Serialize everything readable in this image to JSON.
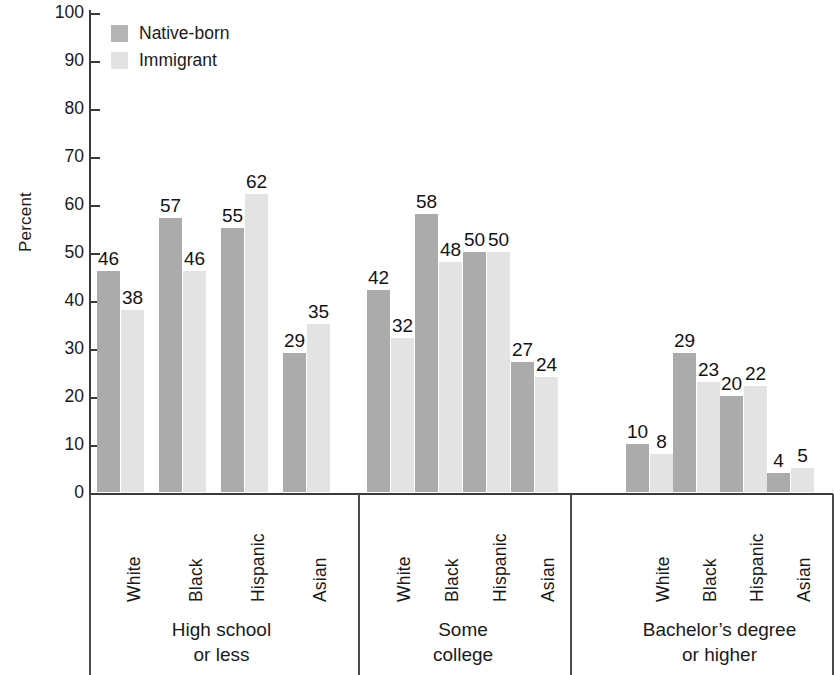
{
  "chart_data": {
    "type": "bar",
    "title": "",
    "xlabel": "",
    "ylabel": "Percent",
    "ylim": [
      0,
      100
    ],
    "ytick_step": 10,
    "yticks": [
      100,
      90,
      80,
      70,
      60,
      50,
      40,
      30,
      20,
      10,
      0
    ],
    "grid": false,
    "legend_position": "top-left",
    "orientation": "vertical",
    "groups": [
      {
        "title_line1": "High school",
        "title_line2": "or less",
        "categories": [
          "White",
          "Black",
          "Hispanic",
          "Asian"
        ],
        "series": [
          {
            "name": "Native-born",
            "values": [
              46,
              57,
              55,
              29
            ]
          },
          {
            "name": "Immigrant",
            "values": [
              38,
              46,
              62,
              35
            ]
          }
        ]
      },
      {
        "title_line1": "Some",
        "title_line2": "college",
        "categories": [
          "White",
          "Black",
          "Hispanic",
          "Asian"
        ],
        "series": [
          {
            "name": "Native-born",
            "values": [
              42,
              58,
              50,
              27
            ]
          },
          {
            "name": "Immigrant",
            "values": [
              32,
              48,
              50,
              24
            ]
          }
        ]
      },
      {
        "title_line1": "Bachelor’s degree",
        "title_line2": "or higher",
        "categories": [
          "White",
          "Black",
          "Hispanic",
          "Asian"
        ],
        "series": [
          {
            "name": "Native-born",
            "values": [
              10,
              29,
              20,
              4
            ]
          },
          {
            "name": "Immigrant",
            "values": [
              8,
              23,
              22,
              5
            ]
          }
        ]
      }
    ],
    "colors": {
      "native_born": "#ababab",
      "immigrant": "#e3e3e3",
      "axis": "#3a3a3a",
      "text": "#141414",
      "background": "#ffffff"
    }
  },
  "legend": {
    "items": [
      {
        "label": "Native-born",
        "swatch": "native"
      },
      {
        "label": "Immigrant",
        "swatch": "immigrant"
      }
    ]
  },
  "axis": {
    "y_title": "Percent"
  }
}
